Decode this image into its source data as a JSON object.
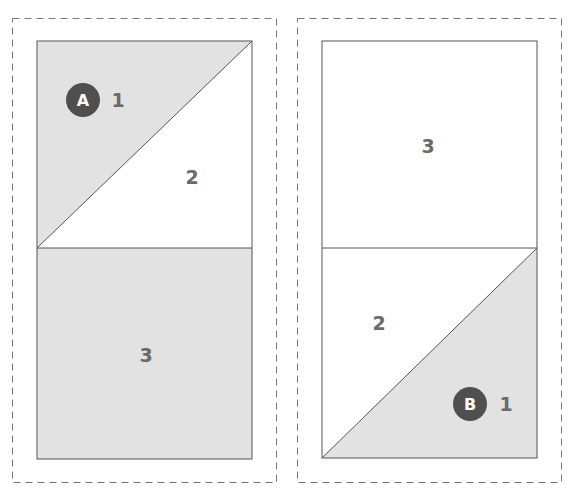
{
  "caption": "",
  "colors": {
    "shaded": "#e2e2e2",
    "unshaded": "#ffffff",
    "outline": "#555555",
    "dashed_frame": "#777777",
    "badge": "#4f4f4f",
    "number": "#6a6a6a"
  },
  "panels": [
    {
      "id": "A",
      "badge_label": "A",
      "pieces": [
        {
          "number": "1",
          "shaded": true,
          "shape": "upper-left triangle of top square"
        },
        {
          "number": "2",
          "shaded": false,
          "shape": "lower-right triangle of top square"
        },
        {
          "number": "3",
          "shaded": true,
          "shape": "bottom square"
        }
      ]
    },
    {
      "id": "B",
      "badge_label": "B",
      "pieces": [
        {
          "number": "3",
          "shaded": false,
          "shape": "top square"
        },
        {
          "number": "2",
          "shaded": false,
          "shape": "upper-left triangle of bottom square"
        },
        {
          "number": "1",
          "shaded": true,
          "shape": "lower-right triangle of bottom square"
        }
      ]
    }
  ]
}
